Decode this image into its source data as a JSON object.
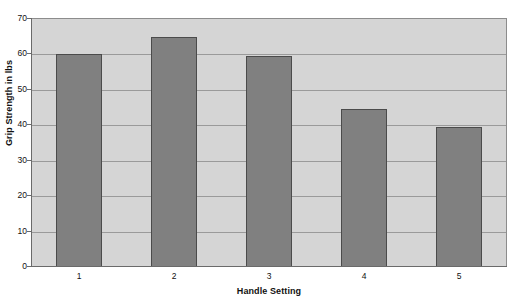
{
  "chart_data": {
    "type": "bar",
    "title": "",
    "xlabel": "Handle Setting",
    "ylabel": "Grip Strength in lbs",
    "categories": [
      "1",
      "2",
      "3",
      "4",
      "5"
    ],
    "values": [
      60,
      64.8,
      59.5,
      44.5,
      39.5
    ],
    "ylim": [
      0,
      70
    ],
    "xlim_categories": 5,
    "y_ticks": [
      0,
      10,
      20,
      30,
      40,
      50,
      60,
      70
    ],
    "y_tick_labels": [
      "0",
      "10",
      "20",
      "30",
      "40",
      "50",
      "60",
      "70"
    ],
    "grid": true,
    "grid_axis": "y",
    "legend": false,
    "legend_position": "none",
    "series": [
      {
        "name": "Grip Strength",
        "values": [
          60,
          64.8,
          59.5,
          44.5,
          39.5
        ]
      }
    ],
    "colors": {
      "bar_fill": "#808080",
      "bar_border": "#4b4b4b",
      "plot_background": "#d5d5d5",
      "page_background": "#ffffff",
      "gridline": "#9a9a9a",
      "axis_line": "#6a6a6a",
      "text": "#111111"
    }
  }
}
